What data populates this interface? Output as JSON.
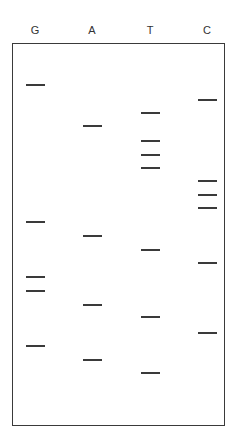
{
  "gel": {
    "lanes": [
      {
        "label": "G",
        "x": 35
      },
      {
        "label": "A",
        "x": 92
      },
      {
        "label": "T",
        "x": 150
      },
      {
        "label": "C",
        "x": 207
      }
    ],
    "bands": [
      {
        "lane": "G",
        "y": 85
      },
      {
        "lane": "C",
        "y": 100
      },
      {
        "lane": "T",
        "y": 113
      },
      {
        "lane": "A",
        "y": 126
      },
      {
        "lane": "T",
        "y": 141
      },
      {
        "lane": "T",
        "y": 155
      },
      {
        "lane": "T",
        "y": 168
      },
      {
        "lane": "C",
        "y": 181
      },
      {
        "lane": "C",
        "y": 195
      },
      {
        "lane": "C",
        "y": 208
      },
      {
        "lane": "G",
        "y": 222
      },
      {
        "lane": "A",
        "y": 236
      },
      {
        "lane": "T",
        "y": 250
      },
      {
        "lane": "C",
        "y": 263
      },
      {
        "lane": "G",
        "y": 277
      },
      {
        "lane": "G",
        "y": 291
      },
      {
        "lane": "A",
        "y": 305
      },
      {
        "lane": "T",
        "y": 317
      },
      {
        "lane": "C",
        "y": 333
      },
      {
        "lane": "G",
        "y": 346
      },
      {
        "lane": "A",
        "y": 360
      },
      {
        "lane": "T",
        "y": 373
      }
    ]
  },
  "colors": {
    "band": "#3a3a3a",
    "frame": "#3a3a3a",
    "label": "#333333"
  }
}
